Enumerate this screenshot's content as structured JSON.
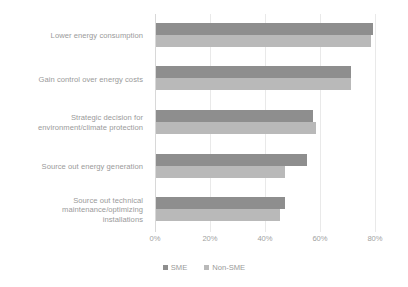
{
  "chart_data": {
    "type": "bar",
    "orientation": "horizontal",
    "title": "",
    "xlabel": "",
    "ylabel": "",
    "xlim": [
      0,
      80
    ],
    "xticks": [
      "0%",
      "20%",
      "40%",
      "60%",
      "80%"
    ],
    "xtick_values": [
      0,
      20,
      40,
      60,
      80
    ],
    "grid": true,
    "legend_position": "bottom-center",
    "categories": [
      "Lower energy consumption",
      "Gain control over energy costs",
      "Strategic decision for environment/climate protection",
      "Source out energy generation",
      "Source out technical maintenance/optimizing installations"
    ],
    "category_lines": [
      [
        "Lower energy consumption"
      ],
      [
        "Gain control over energy costs"
      ],
      [
        "Strategic decision for",
        "environment/climate protection"
      ],
      [
        "Source out energy generation"
      ],
      [
        "Source out technical",
        "maintenance/optimizing",
        "installations"
      ]
    ],
    "series": [
      {
        "name": "SME",
        "color": "#8e8e8e",
        "values": [
          79,
          71,
          57,
          55,
          47
        ]
      },
      {
        "name": "Non-SME",
        "color": "#b9b9b9",
        "values": [
          78,
          71,
          58,
          47,
          45
        ]
      }
    ]
  },
  "legend": {
    "items": [
      {
        "label": "SME",
        "color": "#8e8e8e"
      },
      {
        "label": "Non-SME",
        "color": "#b9b9b9"
      }
    ]
  },
  "colors": {
    "background": "#ffffff",
    "gridline": "#e9e9e9",
    "axis": "#d8d8d8",
    "text": "#9a9a9a"
  }
}
